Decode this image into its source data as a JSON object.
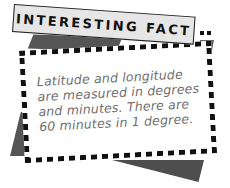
{
  "header": {
    "title": "INTERESTING FACT"
  },
  "fact": {
    "lines": [
      "Latitude and longitude",
      "are measured in degrees",
      "and minutes. There are",
      "60 minutes in 1 degree."
    ]
  },
  "colors": {
    "header_bg": "#e6e6e6",
    "border": "#111111",
    "shadow": "#555555",
    "text": "#6f6f6f",
    "card_bg": "#ffffff"
  }
}
